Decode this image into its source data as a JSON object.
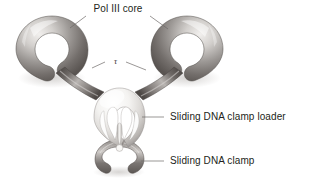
{
  "figure": {
    "background_color": "#ffffff",
    "width": 309,
    "height": 184
  },
  "labels": {
    "pol_iii_core": "Pol III core",
    "tau_subunit": "τ",
    "clamp_loader": "Sliding DNA clamp loader",
    "sliding_clamp": "Sliding DNA clamp"
  },
  "colors": {
    "text": "#231f20",
    "leader_line": "#6e6a68",
    "core_ring_dark": "#6b6663",
    "core_ring_mid": "#a8a4a1",
    "core_ring_light": "#e8e6e4",
    "arm_dark": "#57524f",
    "arm_light": "#b5b1ae",
    "loader_light": "#fbfbfa",
    "loader_mid": "#d6d3d0",
    "loader_shadow": "#9b9794",
    "clamp_dark": "#6f6a67",
    "clamp_light": "#c9c6c3",
    "background": "#ffffff"
  },
  "structures": {
    "pol_iii_core_left": "C-shaped toroidal ring, upper left, gap opening toward lower right",
    "pol_iii_core_right": "C-shaped toroidal ring, upper right, gap opening toward lower left",
    "tau_arm_left": "tubular arm connecting left core ring to central clamp loader",
    "tau_arm_right": "tubular arm connecting right core ring to central clamp loader",
    "clamp_loader_body": "pale dome-shaped body with three leg openings at center",
    "sliding_clamp_ring": "dark split ring beneath the clamp loader"
  }
}
